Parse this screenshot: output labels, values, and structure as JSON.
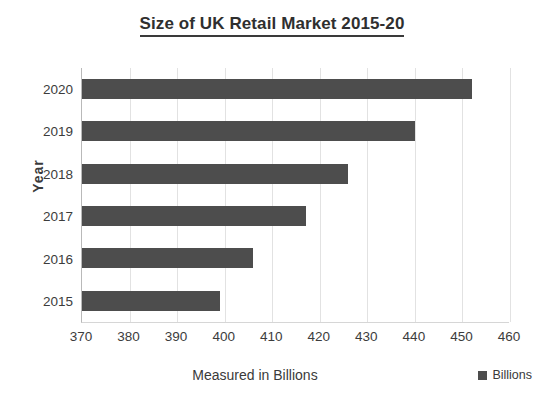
{
  "chart_data": {
    "type": "bar",
    "orientation": "horizontal",
    "title": "Size of UK Retail Market 2015-20",
    "xlabel": "Measured in Billions",
    "ylabel": "Year",
    "categories": [
      "2020",
      "2019",
      "2018",
      "2017",
      "2016",
      "2015"
    ],
    "values": [
      452,
      440,
      426,
      417,
      406,
      399
    ],
    "series": [
      {
        "name": "Billions",
        "color": "#4d4d4d",
        "values": [
          452,
          440,
          426,
          417,
          406,
          399
        ]
      }
    ],
    "xlim": [
      370,
      460
    ],
    "xticks": [
      370,
      380,
      390,
      400,
      410,
      420,
      430,
      440,
      450,
      460
    ],
    "xtick_labels": [
      "370",
      "380",
      "390",
      "400",
      "410",
      "420",
      "430",
      "440",
      "450",
      "460"
    ],
    "grid": "vertical",
    "legend": {
      "position": "bottom-right",
      "entries": [
        {
          "label": "Billions",
          "color": "#4d4d4d",
          "marker": "square-swatch"
        }
      ]
    },
    "bar_color": "#4d4d4d",
    "background_color": "#ffffff",
    "gridline_color": "#e2e2e2"
  }
}
